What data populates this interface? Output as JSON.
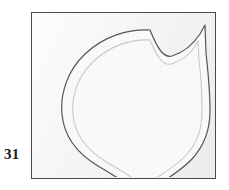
{
  "plate": {
    "figure_number": "31",
    "frame": {
      "x": 31,
      "y": 12,
      "width": 185,
      "height": 167,
      "border_color": "#4a4a4e",
      "background_color": "#f1f1f1"
    },
    "drawing": {
      "title": "",
      "subject_outline_name": "heart-shaped-shield-outline",
      "outer_contour_color": "#55555a",
      "inner_contour_color": "#c9c9c9",
      "fill_color": "#fafafa",
      "outer_contour_path": "M 118 17 C 96 16 72 23 53 41 C 36 57 28 80 30 101 C 32 124 46 141 66 153 C 83 163 97 172 110 180 L 112 182 L 116 179 C 132 167 148 159 160 146 C 172 133 178 116 178 98 C 178 78 176 58 174 40 L 173 12 L 168 21 C 160 33 150 40 140 43 C 132 45 126 37 118 17 Z",
      "inner_contour_path": "M 118 27 C 98 26 77 33 61 49 C 46 63 39 83 41 102 C 43 122 55 137 73 148 C 88 157 101 165 112 172 L 114 173 L 117 170 C 131 160 145 153 155 141 C 165 130 170 115 170 99 C 170 81 169 63 167 47 L 166 28 L 162 35 C 155 44 147 49 139 51 C 131 53 125 44 118 27 Z"
    }
  }
}
